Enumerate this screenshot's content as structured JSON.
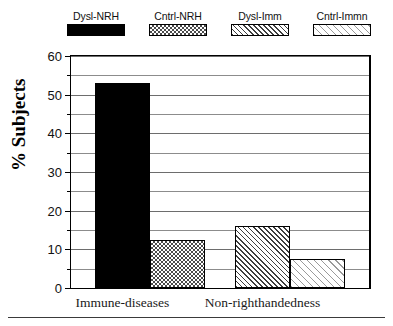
{
  "chart_data": {
    "type": "bar",
    "title": "",
    "xlabel": "",
    "ylabel": "% Subjects",
    "ylim": [
      0,
      60
    ],
    "ytick_labels": [
      "0",
      "10",
      "20",
      "30",
      "40",
      "50",
      "60"
    ],
    "ytick_values": [
      0,
      10,
      20,
      30,
      40,
      50,
      60
    ],
    "minor_tick_values": [
      5,
      15,
      25,
      35,
      45,
      55
    ],
    "grid": true,
    "legend_position": "top",
    "categories": [
      "Immune-diseases",
      "Non-righthandedness"
    ],
    "series": [
      {
        "name": "Dysl-NRH",
        "pattern": "solid-black",
        "values": [
          53,
          null
        ]
      },
      {
        "name": "Cntrl-NRH",
        "pattern": "checkerboard",
        "values": [
          12.5,
          null
        ]
      },
      {
        "name": "Dysl-Imm",
        "pattern": "dense-diagonal-hatch",
        "values": [
          null,
          16
        ]
      },
      {
        "name": "Cntrl-Immn",
        "pattern": "light-diagonal-hatch",
        "values": [
          null,
          7.5
        ]
      }
    ],
    "bars": [
      {
        "series": "Dysl-NRH",
        "category": "Immune-diseases",
        "value": 53,
        "pattern": "solid-black"
      },
      {
        "series": "Cntrl-NRH",
        "category": "Immune-diseases",
        "value": 12.5,
        "pattern": "checkerboard"
      },
      {
        "series": "Dysl-Imm",
        "category": "Non-righthandedness",
        "value": 16,
        "pattern": "dense-diagonal-hatch"
      },
      {
        "series": "Cntrl-Immn",
        "category": "Non-righthandedness",
        "value": 7.5,
        "pattern": "light-diagonal-hatch"
      }
    ]
  },
  "legend": {
    "entries": [
      {
        "label": "Dysl-NRH"
      },
      {
        "label": "Cntrl-NRH"
      },
      {
        "label": "Dysl-Imm"
      },
      {
        "label": "Cntrl-Immn"
      }
    ]
  },
  "axis": {
    "y_title": "% Subjects",
    "y_labels": [
      "60",
      "50",
      "40",
      "30",
      "20",
      "10",
      "0"
    ],
    "x_labels": [
      "Immune-diseases",
      "Non-righthandedness"
    ]
  },
  "colors": {
    "ink": "#000000",
    "grid": "#8c8c8c",
    "background": "#ffffff",
    "hatch_dark": "#3d3d3d",
    "hatch_light": "#9a9a9a"
  }
}
